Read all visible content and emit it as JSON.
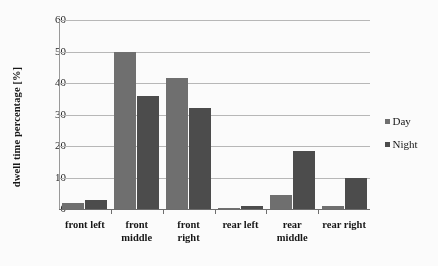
{
  "chart_data": {
    "type": "bar",
    "title": "",
    "subtitle": "",
    "xlabel": "",
    "ylabel": "dwell time percentage [%]",
    "categories": [
      "front left",
      "front middle",
      "front right",
      "rear left",
      "rear middle",
      "rear right"
    ],
    "category_lines": [
      [
        "front left",
        ""
      ],
      [
        "front",
        "middle"
      ],
      [
        "front",
        "right"
      ],
      [
        "rear left",
        ""
      ],
      [
        "rear",
        "middle"
      ],
      [
        "rear right",
        ""
      ]
    ],
    "series": [
      {
        "name": "Day",
        "color": "#6e6e6e",
        "values": [
          2.0,
          50.0,
          41.5,
          0.4,
          4.3,
          1.0
        ]
      },
      {
        "name": "Night",
        "color": "#4a4a4a",
        "values": [
          2.8,
          36.0,
          32.0,
          0.9,
          18.5,
          10.0
        ]
      }
    ],
    "ylim": [
      0,
      60
    ],
    "yticks": [
      0,
      10,
      20,
      30,
      40,
      50,
      60
    ],
    "ytick_labels": [
      "0",
      "10",
      "20",
      "30",
      "40",
      "50",
      "60"
    ],
    "grid": true,
    "grid_axis": "y",
    "legend_position": "right",
    "legend": [
      "Day",
      "Night"
    ]
  },
  "colors": {
    "background": "#ffffff",
    "gridline": "#b9b9b9",
    "axis": "#6d6d6d",
    "text": "#141414",
    "day": "#6e6e6e",
    "night": "#4a4a4a"
  }
}
